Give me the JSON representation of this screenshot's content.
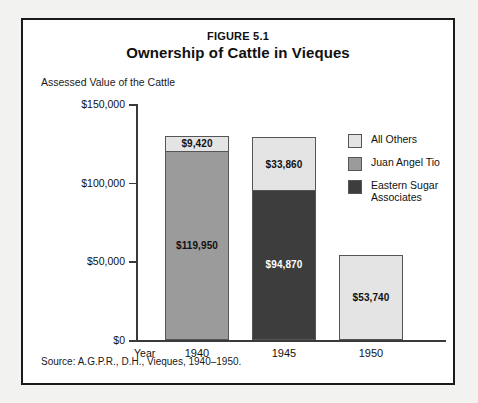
{
  "figure": {
    "number": "FIGURE 5.1",
    "title": "Ownership of Cattle in Vieques",
    "axis_caption": "Assessed Value of the Cattle",
    "x_axis_name": "Year",
    "source": "Source: A.G.P.R., D.H., Vieques, 1940–1950."
  },
  "legend": {
    "items": [
      {
        "label": "All Others",
        "color": "#e4e4e4"
      },
      {
        "label": "Juan Angel Tio",
        "color": "#9b9b9b"
      },
      {
        "label": "Eastern Sugar Associates",
        "color": "#3d3d3d"
      }
    ]
  },
  "chart_data": {
    "type": "bar",
    "subtype": "stacked",
    "title": "Ownership of Cattle in Vieques",
    "subtitle": "FIGURE 5.1",
    "xlabel": "Year",
    "ylabel": "Assessed Value of the Cattle",
    "ylim": [
      0,
      150000
    ],
    "grid": false,
    "legend_position": "right",
    "source": "Source: A.G.P.R., D.H., Vieques, 1940–1950.",
    "categories": [
      "1940",
      "1945",
      "1950"
    ],
    "ytick_labels": [
      "$0",
      "$50,000",
      "$100,000",
      "$150,000"
    ],
    "ytick_values": [
      0,
      50000,
      100000,
      150000
    ],
    "series": [
      {
        "name": "Juan Angel Tio",
        "color": "#9b9b9b",
        "values": [
          119950,
          0,
          0
        ],
        "labels": [
          "$119,950",
          "",
          ""
        ]
      },
      {
        "name": "Eastern Sugar Associates",
        "color": "#3d3d3d",
        "values": [
          0,
          94870,
          0
        ],
        "labels": [
          "",
          "$94,870",
          ""
        ]
      },
      {
        "name": "All Others",
        "color": "#e4e4e4",
        "values": [
          9420,
          33860,
          53740
        ],
        "labels": [
          "$9,420",
          "$33,860",
          "$53,740"
        ]
      }
    ],
    "totals": [
      129370,
      128730,
      53740
    ]
  }
}
